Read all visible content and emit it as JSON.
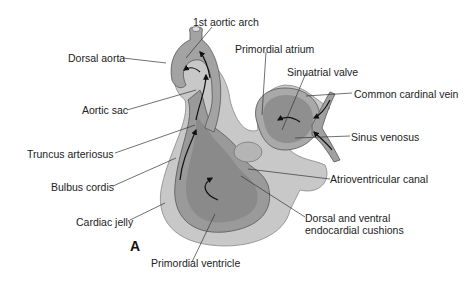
{
  "figure": {
    "panel_letter": "A",
    "colors": {
      "cardiac_jelly": "#c8c8c8",
      "wall": "#a9a9a9",
      "lumen": "#8e8e8e",
      "line": "#333333",
      "background": "#ffffff"
    }
  },
  "labels": {
    "first_aortic_arch": "1st aortic arch",
    "dorsal_aorta": "Dorsal aorta",
    "primordial_atrium": "Primordial atrium",
    "sinuatrial_valve": "Sinuatrial valve",
    "common_cardinal_vein": "Common cardinal vein",
    "aortic_sac": "Aortic sac",
    "sinus_venosus": "Sinus venosus",
    "truncus_arteriosus": "Truncus arteriosus",
    "bulbus_cordis": "Bulbus cordis",
    "atrioventricular_canal": "Atrioventricular canal",
    "cardiac_jelly": "Cardiac jelly",
    "endocardial_cushions": "Dorsal and ventral endocardial cushions",
    "primordial_ventricle": "Primordial ventricle"
  }
}
